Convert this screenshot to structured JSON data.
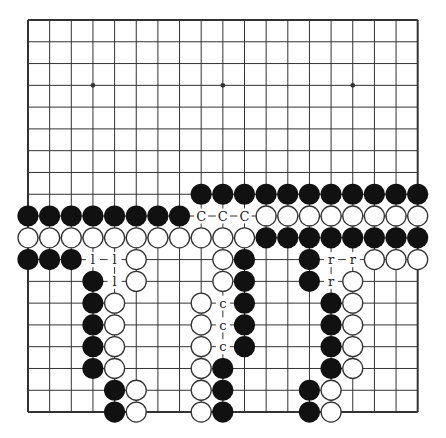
{
  "diagram": {
    "type": "go-board",
    "size": 19,
    "star_points": [
      [
        4,
        4
      ],
      [
        10,
        4
      ],
      [
        16,
        4
      ]
    ],
    "colors": {
      "background": "#ffffff",
      "line": "#333333",
      "black_stone": "#111111",
      "white_stone": "#ffffff",
      "white_outline": "#333333"
    },
    "stones": {
      "black": [
        [
          9,
          9
        ],
        [
          10,
          9
        ],
        [
          11,
          9
        ],
        [
          12,
          9
        ],
        [
          13,
          9
        ],
        [
          14,
          9
        ],
        [
          15,
          9
        ],
        [
          16,
          9
        ],
        [
          17,
          9
        ],
        [
          18,
          9
        ],
        [
          19,
          9
        ],
        [
          1,
          10
        ],
        [
          2,
          10
        ],
        [
          3,
          10
        ],
        [
          4,
          10
        ],
        [
          5,
          10
        ],
        [
          6,
          10
        ],
        [
          7,
          10
        ],
        [
          8,
          10
        ],
        [
          12,
          11
        ],
        [
          13,
          11
        ],
        [
          14,
          11
        ],
        [
          15,
          11
        ],
        [
          16,
          11
        ],
        [
          17,
          11
        ],
        [
          18,
          11
        ],
        [
          19,
          11
        ],
        [
          1,
          12
        ],
        [
          2,
          12
        ],
        [
          3,
          12
        ],
        [
          11,
          12
        ],
        [
          14,
          12
        ],
        [
          4,
          13
        ],
        [
          11,
          13
        ],
        [
          14,
          13
        ],
        [
          4,
          14
        ],
        [
          11,
          14
        ],
        [
          15,
          14
        ],
        [
          4,
          15
        ],
        [
          11,
          15
        ],
        [
          15,
          15
        ],
        [
          4,
          16
        ],
        [
          11,
          16
        ],
        [
          15,
          16
        ],
        [
          4,
          17
        ],
        [
          10,
          17
        ],
        [
          15,
          17
        ],
        [
          5,
          18
        ],
        [
          10,
          18
        ],
        [
          14,
          18
        ],
        [
          5,
          19
        ],
        [
          10,
          19
        ],
        [
          14,
          19
        ]
      ],
      "white": [
        [
          12,
          10
        ],
        [
          13,
          10
        ],
        [
          14,
          10
        ],
        [
          15,
          10
        ],
        [
          16,
          10
        ],
        [
          17,
          10
        ],
        [
          18,
          10
        ],
        [
          19,
          10
        ],
        [
          1,
          11
        ],
        [
          2,
          11
        ],
        [
          3,
          11
        ],
        [
          4,
          11
        ],
        [
          5,
          11
        ],
        [
          6,
          11
        ],
        [
          7,
          11
        ],
        [
          8,
          11
        ],
        [
          9,
          11
        ],
        [
          10,
          11
        ],
        [
          11,
          11
        ],
        [
          6,
          12
        ],
        [
          10,
          12
        ],
        [
          17,
          12
        ],
        [
          18,
          12
        ],
        [
          19,
          12
        ],
        [
          6,
          13
        ],
        [
          10,
          13
        ],
        [
          16,
          13
        ],
        [
          5,
          14
        ],
        [
          9,
          14
        ],
        [
          16,
          14
        ],
        [
          5,
          15
        ],
        [
          9,
          15
        ],
        [
          16,
          15
        ],
        [
          5,
          16
        ],
        [
          9,
          16
        ],
        [
          16,
          16
        ],
        [
          5,
          17
        ],
        [
          9,
          17
        ],
        [
          16,
          17
        ],
        [
          6,
          18
        ],
        [
          9,
          18
        ],
        [
          15,
          18
        ],
        [
          6,
          19
        ],
        [
          9,
          19
        ],
        [
          15,
          19
        ]
      ]
    },
    "labels": [
      {
        "col": 9,
        "row": 10,
        "text": "C"
      },
      {
        "col": 10,
        "row": 10,
        "text": "C"
      },
      {
        "col": 11,
        "row": 10,
        "text": "C"
      },
      {
        "col": 4,
        "row": 12,
        "text": "l"
      },
      {
        "col": 5,
        "row": 12,
        "text": "l"
      },
      {
        "col": 5,
        "row": 13,
        "text": "l"
      },
      {
        "col": 10,
        "row": 14,
        "text": "c"
      },
      {
        "col": 10,
        "row": 15,
        "text": "c"
      },
      {
        "col": 10,
        "row": 16,
        "text": "c"
      },
      {
        "col": 15,
        "row": 12,
        "text": "r"
      },
      {
        "col": 16,
        "row": 12,
        "text": "r"
      },
      {
        "col": 15,
        "row": 13,
        "text": "r"
      }
    ]
  }
}
